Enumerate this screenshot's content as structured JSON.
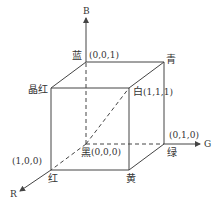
{
  "diagram": {
    "axes": {
      "b": {
        "label": "B"
      },
      "g": {
        "label": "G"
      },
      "r": {
        "label": "R"
      }
    },
    "vertices": {
      "black": {
        "name": "黑",
        "coord": "(0,0,0)"
      },
      "blue": {
        "name": "蓝",
        "coord": "(0,0,1)"
      },
      "green": {
        "name": "绿",
        "coord": "(0,1,0)"
      },
      "red": {
        "name": "红",
        "coord": "(1,0,0)"
      },
      "cyan": {
        "name": "青",
        "coord": ""
      },
      "magenta": {
        "name": "晶红",
        "coord": ""
      },
      "yellow": {
        "name": "黄",
        "coord": ""
      },
      "white": {
        "name": "白",
        "coord": "(1,1,1)"
      }
    }
  }
}
